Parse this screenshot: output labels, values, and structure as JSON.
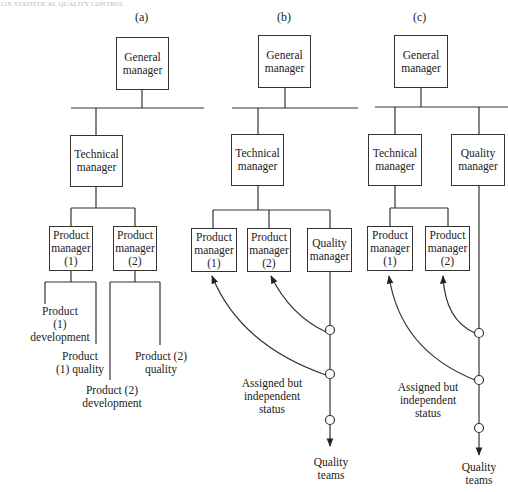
{
  "page": {
    "header_fragment": "12X   STATISTICAL QUALITY CONTROL"
  },
  "panels": [
    {
      "id": "a",
      "label": "(a)"
    },
    {
      "id": "b",
      "label": "(b)"
    },
    {
      "id": "c",
      "label": "(c)"
    }
  ],
  "boxes": [
    {
      "id": "a-gm",
      "lines": [
        "General",
        "manager"
      ],
      "x": 116,
      "y": 37,
      "w": 53,
      "h": 53
    },
    {
      "id": "a-tm",
      "lines": [
        "Technical",
        "manager"
      ],
      "x": 70,
      "y": 135,
      "w": 53,
      "h": 52
    },
    {
      "id": "a-pm1",
      "lines": [
        "Product",
        "manager",
        "(1)"
      ],
      "x": 49,
      "y": 226,
      "w": 44,
      "h": 45
    },
    {
      "id": "a-pm2",
      "lines": [
        "Product",
        "manager",
        "(2)"
      ],
      "x": 113,
      "y": 226,
      "w": 44,
      "h": 45
    },
    {
      "id": "b-gm",
      "lines": [
        "General",
        "manager"
      ],
      "x": 258,
      "y": 35,
      "w": 53,
      "h": 53
    },
    {
      "id": "b-tm",
      "lines": [
        "Technical",
        "manager"
      ],
      "x": 231,
      "y": 134,
      "w": 53,
      "h": 52
    },
    {
      "id": "b-pm1",
      "lines": [
        "Product",
        "manager",
        "(1)"
      ],
      "x": 191,
      "y": 228,
      "w": 46,
      "h": 44
    },
    {
      "id": "b-pm2",
      "lines": [
        "Product",
        "manager",
        "(2)"
      ],
      "x": 247,
      "y": 228,
      "w": 44,
      "h": 44
    },
    {
      "id": "b-qm",
      "lines": [
        "Quality",
        "manager"
      ],
      "x": 307,
      "y": 228,
      "w": 45,
      "h": 44
    },
    {
      "id": "c-gm",
      "lines": [
        "General",
        "manager"
      ],
      "x": 394,
      "y": 35,
      "w": 54,
      "h": 53
    },
    {
      "id": "c-tm",
      "lines": [
        "Technical",
        "manager"
      ],
      "x": 368,
      "y": 134,
      "w": 54,
      "h": 52
    },
    {
      "id": "c-qm",
      "lines": [
        "Quality",
        "manager"
      ],
      "x": 451,
      "y": 134,
      "w": 54,
      "h": 52
    },
    {
      "id": "c-pm1",
      "lines": [
        "Product",
        "manager",
        "(1)"
      ],
      "x": 367,
      "y": 226,
      "w": 46,
      "h": 45
    },
    {
      "id": "c-pm2",
      "lines": [
        "Product",
        "manager",
        "(2)"
      ],
      "x": 425,
      "y": 226,
      "w": 45,
      "h": 45
    }
  ],
  "labels": [
    {
      "id": "a-p1-dev",
      "lines": [
        "Product",
        "(1)",
        "development"
      ],
      "cx": 60,
      "y": 305
    },
    {
      "id": "a-p1-qual",
      "lines": [
        "Product",
        "(1) quality"
      ],
      "cx": 80,
      "y": 350
    },
    {
      "id": "a-p2-qual",
      "lines": [
        "Product (2)",
        "quality"
      ],
      "cx": 161,
      "y": 350
    },
    {
      "id": "a-p2-dev",
      "lines": [
        "Product (2)",
        "development"
      ],
      "cx": 112,
      "y": 384
    },
    {
      "id": "b-assigned",
      "lines": [
        "Assigned but",
        "independent",
        "status"
      ],
      "cx": 272,
      "y": 377
    },
    {
      "id": "b-teams",
      "lines": [
        "Quality",
        "teams"
      ],
      "cx": 331,
      "y": 456
    },
    {
      "id": "c-assigned",
      "lines": [
        "Assigned but",
        "independent",
        "status"
      ],
      "cx": 428,
      "y": 381
    },
    {
      "id": "c-teams",
      "lines": [
        "Quality",
        "teams"
      ],
      "cx": 479,
      "y": 461
    }
  ]
}
